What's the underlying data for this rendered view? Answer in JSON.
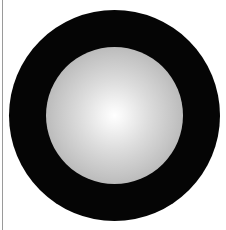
{
  "figure": {
    "outer_disc": {
      "color": "#050505",
      "center": [
        114,
        115
      ],
      "radius": 105
    },
    "inner_sphere": {
      "highlight_color": "#ffffff",
      "edge_color": "#a2a2a2",
      "center": [
        114,
        115
      ],
      "radius": 68
    }
  },
  "colors": {
    "background": "#ffffff",
    "border": "#9a9a9a"
  }
}
